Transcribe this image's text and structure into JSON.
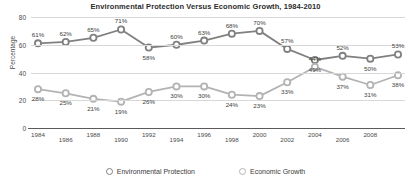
{
  "chart_data": {
    "type": "line",
    "title": "Environmental Protection Versus Economic Growth, 1984-2010",
    "xlabel": "",
    "ylabel": "Percentage",
    "ylim": [
      0,
      80
    ],
    "yticks": [
      0,
      20,
      40,
      60,
      80
    ],
    "grid": true,
    "legend_position": "bottom",
    "x": [
      1984,
      1986,
      1988,
      1990,
      1992,
      1994,
      1996,
      1998,
      2000,
      2002,
      2004,
      2006,
      2008,
      2010
    ],
    "xtick_labels": [
      "1984",
      "1986",
      "1988",
      "1990",
      "1992",
      "1994",
      "1996",
      "1998",
      "2000",
      "2002",
      "2004",
      "2006",
      "2008"
    ],
    "series": [
      {
        "name": "Environmental Protection",
        "color": "#808080",
        "values": [
          61,
          62,
          65,
          71,
          58,
          60,
          63,
          68,
          70,
          57,
          49,
          52,
          50,
          53
        ],
        "labels": [
          "61%",
          "62%",
          "65%",
          "71%",
          "58%",
          "60%",
          "63%",
          "68%",
          "70%",
          "57%",
          "49%",
          "52%",
          "50%",
          "53%"
        ]
      },
      {
        "name": "Economic Growth",
        "color": "#b3b3b3",
        "values": [
          28,
          25,
          21,
          19,
          26,
          30,
          30,
          24,
          23,
          33,
          44,
          37,
          31,
          38
        ],
        "labels": [
          "28%",
          "25%",
          "21%",
          "19%",
          "26%",
          "30%",
          "30%",
          "24%",
          "23%",
          "33%",
          "44%",
          "37%",
          "31%",
          "38%"
        ]
      }
    ]
  }
}
